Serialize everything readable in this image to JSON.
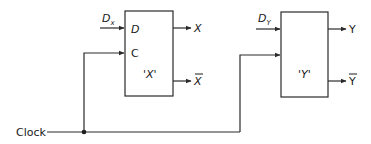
{
  "diagram": {
    "type": "circuit",
    "clock": {
      "label": "Clock"
    },
    "flipflops": [
      {
        "id": "X",
        "name": "'X'",
        "inputs": {
          "data_label": "D",
          "data_source": "D",
          "data_source_sub": "x",
          "clock_label": "C"
        },
        "outputs": {
          "q": "X",
          "q_bar": "X"
        }
      },
      {
        "id": "Y",
        "name": "'Y'",
        "inputs": {
          "data_label": "",
          "data_source": "D",
          "data_source_sub": "Y",
          "clock_label": ""
        },
        "outputs": {
          "q": "Y",
          "q_bar": "Y"
        }
      }
    ],
    "colors": {
      "line": "#2a2a2a",
      "text": "#1a1a1a",
      "background": "#ffffff"
    }
  }
}
